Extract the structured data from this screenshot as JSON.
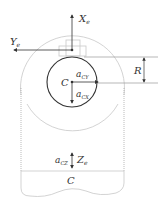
{
  "diagram": {
    "labels": {
      "x_axis": "X",
      "x_axis_sub": "e",
      "y_axis": "Y",
      "y_axis_sub": "e",
      "z_axis": "Z",
      "z_axis_sub": "e",
      "radius": "R",
      "center_top": "C",
      "center_bottom": "C",
      "accel_y": "a",
      "accel_y_sub": "CY",
      "accel_x": "a",
      "accel_x_sub": "CX",
      "accel_z": "a",
      "accel_z_sub": "CZ"
    },
    "colors": {
      "stroke_dark": "#333333",
      "stroke_light": "#c8c8c8",
      "text": "#333333"
    }
  }
}
